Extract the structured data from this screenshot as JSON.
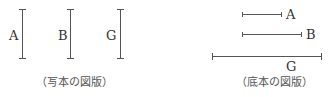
{
  "left_figure": {
    "caption": "（写本の図版）",
    "segments": [
      {
        "label": "A",
        "orientation": "vertical",
        "x": 22,
        "y1": 9,
        "y2": 59
      },
      {
        "label": "B",
        "orientation": "vertical",
        "x": 70,
        "y1": 9,
        "y2": 59
      },
      {
        "label": "G",
        "orientation": "vertical",
        "x": 120,
        "y1": 9,
        "y2": 59
      }
    ]
  },
  "right_figure": {
    "caption": "（底本の図版）",
    "segments": [
      {
        "label": "A",
        "orientation": "horizontal",
        "y": 14,
        "x1": 242,
        "x2": 282
      },
      {
        "label": "B",
        "orientation": "horizontal",
        "y": 34,
        "x1": 242,
        "x2": 302
      },
      {
        "label": "G",
        "orientation": "horizontal",
        "y": 56,
        "x1": 212,
        "x2": 322
      }
    ]
  },
  "colors": {
    "line": "#555555",
    "text": "#333333"
  }
}
